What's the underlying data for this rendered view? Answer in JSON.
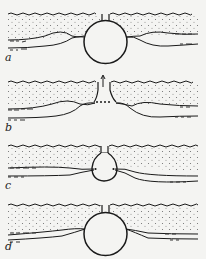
{
  "figure": {
    "panels": [
      {
        "id": "a",
        "label": "a",
        "label_pos": [
          5,
          52
        ],
        "top_y": 14,
        "center": [
          105,
          42
        ],
        "r": 22,
        "type": "full-circle"
      },
      {
        "id": "b",
        "label": "b",
        "label_pos": [
          5,
          122
        ],
        "top_y": 82,
        "center": [
          105,
          100
        ],
        "type": "open-funnel"
      },
      {
        "id": "c",
        "label": "c",
        "label_pos": [
          5,
          180
        ],
        "top_y": 146,
        "center": [
          105,
          172
        ],
        "r": 14,
        "type": "small-bulb"
      },
      {
        "id": "d",
        "label": "d",
        "label_pos": [
          5,
          241
        ],
        "top_y": 205,
        "center": [
          105,
          232
        ],
        "r": 22,
        "type": "full-circle"
      }
    ],
    "colors": {
      "ink": "#1a1a1a",
      "paper": "#f4f4f2",
      "stipple": "#6a6a6a"
    }
  }
}
